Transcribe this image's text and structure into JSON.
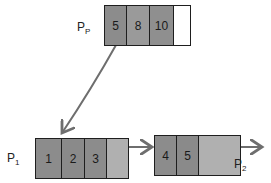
{
  "diagram": {
    "title": "",
    "colors": {
      "key_cell": "#8c8c8c",
      "empty_cell_leaf": "#b0b0b0",
      "empty_cell_parent": "#ffffff",
      "stroke": "#1e1e1e",
      "arrow": "#6e6e6e"
    },
    "parent": {
      "label_main": "P",
      "label_sub": "P",
      "keys": [
        "5",
        "8",
        "10",
        ""
      ]
    },
    "leaf1": {
      "label_main": "P",
      "label_sub": "1",
      "keys": [
        "1",
        "2",
        "3",
        ""
      ]
    },
    "leaf2": {
      "label_main": "P",
      "label_sub": "2",
      "keys": [
        "4",
        "5",
        ""
      ]
    },
    "edges": [
      {
        "from": "parent",
        "to": "leaf1",
        "type": "child-pointer"
      },
      {
        "from": "leaf1",
        "to": "leaf2",
        "type": "sibling-pointer"
      },
      {
        "from": "leaf2",
        "to": "next",
        "type": "sibling-pointer"
      }
    ]
  }
}
